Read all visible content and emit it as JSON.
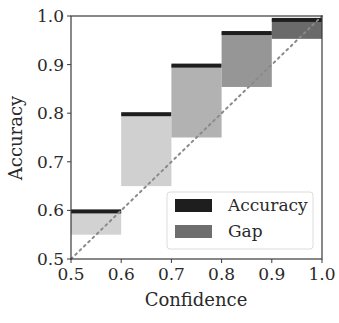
{
  "chart_data": {
    "type": "bar",
    "title": "",
    "xlabel": "Confidence",
    "ylabel": "Accuracy",
    "xlim": [
      0.5,
      1.0
    ],
    "ylim": [
      0.5,
      1.0
    ],
    "grid": false,
    "legend_position": "lower right",
    "x_ticks": [
      "0.5",
      "0.6",
      "0.7",
      "0.8",
      "0.9",
      "1.0"
    ],
    "y_ticks": [
      "0.5",
      "0.6",
      "0.7",
      "0.8",
      "0.9",
      "1.0"
    ],
    "bins": [
      {
        "x_start": 0.5,
        "x_end": 0.6,
        "accuracy": 0.6,
        "gap_bottom": 0.55,
        "gap_color": "#d2d2d2"
      },
      {
        "x_start": 0.6,
        "x_end": 0.7,
        "accuracy": 0.8,
        "gap_bottom": 0.65,
        "gap_color": "#d0d0d0"
      },
      {
        "x_start": 0.7,
        "x_end": 0.8,
        "accuracy": 0.9,
        "gap_bottom": 0.75,
        "gap_color": "#b2b2b2"
      },
      {
        "x_start": 0.8,
        "x_end": 0.9,
        "accuracy": 0.967,
        "gap_bottom": 0.854,
        "gap_color": "#969696"
      },
      {
        "x_start": 0.9,
        "x_end": 1.0,
        "accuracy": 0.994,
        "gap_bottom": 0.953,
        "gap_color": "#6a6a6a"
      }
    ],
    "series": [
      {
        "name": "Accuracy",
        "color": "#1e1e1e",
        "values": [
          0.6,
          0.8,
          0.9,
          0.967,
          0.994
        ]
      },
      {
        "name": "Gap",
        "color": "#6e6e6e",
        "values": [
          0.05,
          0.15,
          0.15,
          0.113,
          0.041
        ]
      }
    ],
    "reference_line": {
      "style": "dotted",
      "color": "#8a8a8a",
      "from": [
        0.5,
        0.5
      ],
      "to": [
        1.0,
        1.0
      ],
      "label": "perfect calibration"
    },
    "legend": [
      {
        "label": "Accuracy",
        "color": "#1e1e1e"
      },
      {
        "label": "Gap",
        "color": "#6e6e6e"
      }
    ]
  }
}
